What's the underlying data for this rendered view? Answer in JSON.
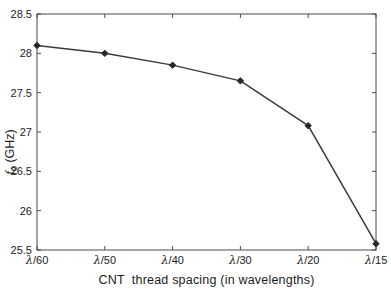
{
  "figure": {
    "background": "#ffffff",
    "axis_color": "#4a4a4a",
    "text_color": "#1c1c1c"
  },
  "chart_data": {
    "type": "line",
    "title": "",
    "categories": [
      "λ/60",
      "λ/50",
      "λ/40",
      "λ/30",
      "λ/20",
      "λ/15"
    ],
    "values": [
      28.1,
      28.0,
      27.85,
      27.65,
      27.08,
      25.58
    ],
    "xlabel": "CNT  thread spacing (in wavelengths)",
    "ylabel": "f_0 (GHz)",
    "ylim": [
      25.5,
      28.5
    ],
    "yticks": [
      25.5,
      26,
      26.5,
      27,
      27.5,
      28,
      28.5
    ],
    "ytick_labels": [
      "25.5",
      "26",
      "26.5",
      "27",
      "27.5",
      "28",
      "28.5"
    ],
    "grid": false,
    "legend": "none",
    "box": true,
    "line_color": "#3a3a3a",
    "line_width": 1.5,
    "marker": "diamond",
    "marker_color": "#262626"
  },
  "ylabel_parts": {
    "f": "f",
    "sub": "0",
    "rest": " (GHz)"
  }
}
